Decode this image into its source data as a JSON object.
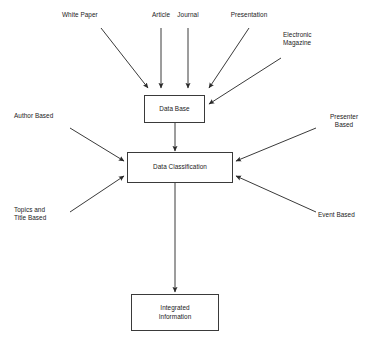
{
  "diagram": {
    "background_color": "#ffffff",
    "line_color": "#3a3a3a",
    "text_color": "#1a1a1a",
    "nodes": [
      {
        "id": "data-base",
        "label": "Data Base"
      },
      {
        "id": "data-classification",
        "label": "Data Classification"
      },
      {
        "id": "integrated-information",
        "label": "Integrated\nInformation"
      }
    ],
    "sources": [
      {
        "id": "white-paper",
        "label": "White Paper"
      },
      {
        "id": "article",
        "label": "Article"
      },
      {
        "id": "journal",
        "label": "Journal"
      },
      {
        "id": "presentation",
        "label": "Presentation"
      },
      {
        "id": "electronic-magazine",
        "label": "Electronic\nMagazine"
      },
      {
        "id": "author-based",
        "label": "Author Based"
      },
      {
        "id": "topics-title-based",
        "label": "Topics and\nTitle Based"
      },
      {
        "id": "presenter-based",
        "label": "Presenter\nBased"
      },
      {
        "id": "event-based",
        "label": "Event Based"
      }
    ],
    "connections": [
      {
        "from": "white-paper",
        "to": "data-base"
      },
      {
        "from": "article",
        "to": "data-base"
      },
      {
        "from": "journal",
        "to": "data-base"
      },
      {
        "from": "presentation",
        "to": "data-base"
      },
      {
        "from": "electronic-magazine",
        "to": "data-base"
      },
      {
        "from": "data-base",
        "to": "data-classification"
      },
      {
        "from": "author-based",
        "to": "data-classification"
      },
      {
        "from": "topics-title-based",
        "to": "data-classification"
      },
      {
        "from": "presenter-based",
        "to": "data-classification"
      },
      {
        "from": "event-based",
        "to": "data-classification"
      },
      {
        "from": "data-classification",
        "to": "integrated-information"
      }
    ]
  }
}
